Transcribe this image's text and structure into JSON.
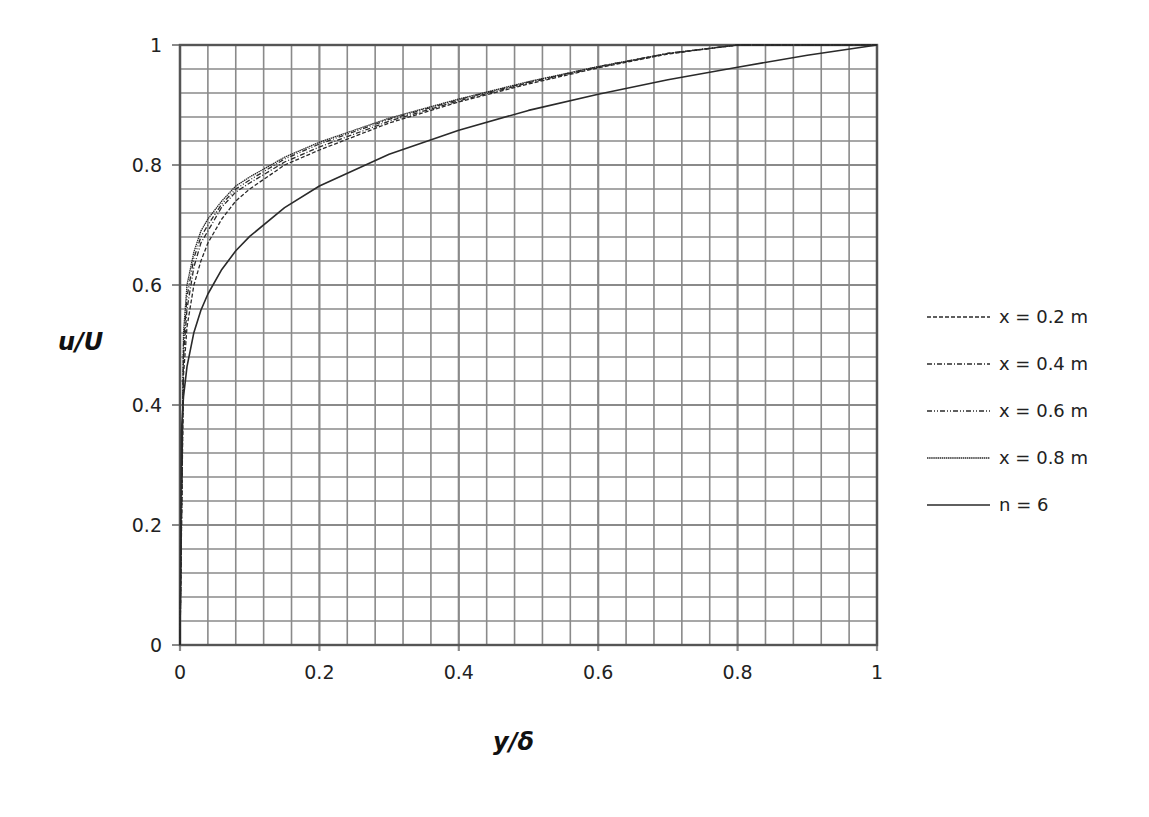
{
  "chart_data": {
    "type": "line",
    "title": "",
    "xlabel": "y/δ",
    "ylabel": "u/U",
    "xlim": [
      0,
      1
    ],
    "ylim": [
      0,
      1
    ],
    "x_ticks": [
      "0",
      "0.2",
      "0.4",
      "0.6",
      "0.8",
      "1"
    ],
    "y_ticks": [
      "0",
      "0.2",
      "0.4",
      "0.6",
      "0.8",
      "1"
    ],
    "grid": true,
    "minor_grid_step": 0.04,
    "legend_position": "right",
    "series": [
      {
        "name": "x = 0.2 m",
        "style": "dashed",
        "x": [
          0,
          0.005,
          0.01,
          0.02,
          0.03,
          0.04,
          0.06,
          0.08,
          0.1,
          0.15,
          0.2,
          0.3,
          0.4,
          0.5,
          0.6,
          0.7,
          0.8,
          0.9,
          1.0
        ],
        "y": [
          0,
          0.45,
          0.53,
          0.6,
          0.64,
          0.67,
          0.71,
          0.74,
          0.76,
          0.8,
          0.825,
          0.87,
          0.905,
          0.935,
          0.962,
          0.985,
          1.0,
          1.0,
          1.0
        ]
      },
      {
        "name": "x = 0.4 m",
        "style": "dash-dot",
        "x": [
          0,
          0.005,
          0.01,
          0.02,
          0.03,
          0.04,
          0.06,
          0.08,
          0.1,
          0.15,
          0.2,
          0.3,
          0.4,
          0.5,
          0.6,
          0.7,
          0.8,
          0.9,
          1.0
        ],
        "y": [
          0,
          0.48,
          0.56,
          0.63,
          0.67,
          0.69,
          0.73,
          0.755,
          0.77,
          0.805,
          0.83,
          0.873,
          0.907,
          0.937,
          0.963,
          0.986,
          1.0,
          1.0,
          1.0
        ]
      },
      {
        "name": "x = 0.6 m",
        "style": "dash-dot-dot",
        "x": [
          0,
          0.005,
          0.01,
          0.02,
          0.03,
          0.04,
          0.06,
          0.08,
          0.1,
          0.15,
          0.2,
          0.3,
          0.4,
          0.5,
          0.6,
          0.7,
          0.8,
          0.9,
          1.0
        ],
        "y": [
          0,
          0.5,
          0.58,
          0.645,
          0.68,
          0.7,
          0.735,
          0.76,
          0.775,
          0.81,
          0.835,
          0.876,
          0.909,
          0.938,
          0.964,
          0.986,
          1.0,
          1.0,
          1.0
        ]
      },
      {
        "name": "x = 0.8 m",
        "style": "dotted-fine",
        "x": [
          0,
          0.005,
          0.01,
          0.02,
          0.03,
          0.04,
          0.06,
          0.08,
          0.1,
          0.15,
          0.2,
          0.3,
          0.4,
          0.5,
          0.6,
          0.7,
          0.8,
          0.9,
          1.0
        ],
        "y": [
          0,
          0.52,
          0.6,
          0.655,
          0.69,
          0.71,
          0.74,
          0.765,
          0.78,
          0.813,
          0.838,
          0.878,
          0.91,
          0.939,
          0.964,
          0.986,
          1.0,
          1.0,
          1.0
        ]
      },
      {
        "name": "n = 6",
        "style": "solid",
        "x": [
          0,
          0.002,
          0.005,
          0.01,
          0.02,
          0.03,
          0.04,
          0.06,
          0.08,
          0.1,
          0.15,
          0.2,
          0.3,
          0.4,
          0.5,
          0.6,
          0.7,
          0.8,
          0.9,
          1.0
        ],
        "y": [
          0,
          0.355,
          0.414,
          0.464,
          0.521,
          0.558,
          0.585,
          0.626,
          0.657,
          0.681,
          0.729,
          0.765,
          0.818,
          0.858,
          0.891,
          0.918,
          0.942,
          0.963,
          0.983,
          1.0
        ]
      }
    ]
  },
  "legend": {
    "items": [
      {
        "label": "x = 0.2 m",
        "dash": "4,2"
      },
      {
        "label": "x = 0.4 m",
        "dash": "5,2,1,2"
      },
      {
        "label": "x = 0.6 m",
        "dash": "5,2,1,2,1,2"
      },
      {
        "label": "x = 0.8 m",
        "dash": "1.5,0.6"
      },
      {
        "label": "n = 6",
        "dash": ""
      }
    ]
  },
  "colors": {
    "grid": "#8a8a8a",
    "axis": "#555555",
    "curve": "#2a2a2a",
    "background": "#ffffff"
  }
}
